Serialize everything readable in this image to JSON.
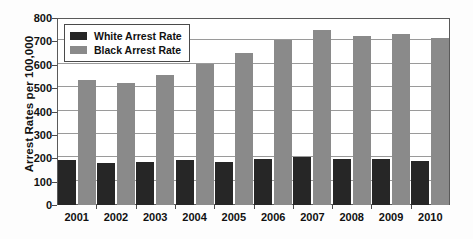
{
  "chart_data": {
    "type": "bar",
    "title": "",
    "xlabel": "",
    "ylabel": "Arrest Rates per 100,000",
    "ylim": [
      0,
      800
    ],
    "ytick_step": 100,
    "yticks": [
      800,
      700,
      600,
      500,
      400,
      300,
      200,
      100,
      0
    ],
    "grid": true,
    "legend_position": "top-left",
    "categories": [
      "2001",
      "2002",
      "2003",
      "2004",
      "2005",
      "2006",
      "2007",
      "2008",
      "2009",
      "2010"
    ],
    "series": [
      {
        "name": "White Arrest Rate",
        "color": "#262626",
        "values": [
          192,
          181,
          185,
          193,
          186,
          198,
          205,
          198,
          197,
          190
        ]
      },
      {
        "name": "Black Arrest Rate",
        "color": "#8a8a8a",
        "values": [
          536,
          521,
          555,
          602,
          650,
          705,
          748,
          722,
          733,
          713
        ]
      }
    ]
  },
  "colors": {
    "white_arrest_rate": "#262626",
    "black_arrest_rate": "#8a8a8a",
    "gridline": "#9a9a9a",
    "frame": "#5a5a5a",
    "text": "#111111",
    "background": "#fdfdfd"
  }
}
